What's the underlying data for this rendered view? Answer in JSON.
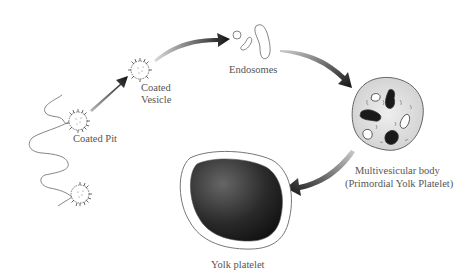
{
  "diagram": {
    "labels": {
      "coated_pit": "Coated Pit",
      "coated_vesicle_line1": "Coated",
      "coated_vesicle_line2": "Vesicle",
      "endosomes": "Endosomes",
      "multivesicular_line1": "Multivesicular body",
      "multivesicular_line2": "(Primordial Yolk Platelet)",
      "yolk_platelet": "Yolk platelet"
    },
    "nodes": [
      {
        "id": "coated-pit",
        "label": "Coated Pit"
      },
      {
        "id": "coated-vesicle",
        "label": "Coated Vesicle"
      },
      {
        "id": "endosomes",
        "label": "Endosomes"
      },
      {
        "id": "multivesicular-body",
        "label": "Multivesicular body (Primordial Yolk Platelet)"
      },
      {
        "id": "yolk-platelet",
        "label": "Yolk platelet"
      }
    ],
    "edges": [
      {
        "from": "coated-pit",
        "to": "coated-vesicle"
      },
      {
        "from": "coated-vesicle",
        "to": "endosomes"
      },
      {
        "from": "endosomes",
        "to": "multivesicular-body"
      },
      {
        "from": "multivesicular-body",
        "to": "yolk-platelet"
      }
    ],
    "colors": {
      "arrow": "#1a1a1a",
      "membrane": "#555555",
      "mvb_fill": "#d8d8d8",
      "platelet_core": "#222222",
      "text": "#555555"
    }
  }
}
